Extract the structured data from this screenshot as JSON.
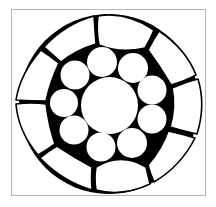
{
  "diagram": {
    "colors": {
      "fill": "#000000",
      "wire": "#ffffff",
      "stroke": "#000000",
      "frame": "#b4b4b4"
    },
    "outer_boundary": {
      "cx": 109,
      "cy": 104,
      "r": 94
    },
    "core": {
      "cx": 109.5,
      "cy": 105.5,
      "r": 28.5
    },
    "inner_ring": [
      {
        "cx": 102,
        "cy": 62,
        "r": 15
      },
      {
        "cx": 133,
        "cy": 68,
        "r": 15
      },
      {
        "cx": 152,
        "cy": 90,
        "r": 14.5
      },
      {
        "cx": 152,
        "cy": 119,
        "r": 14.5
      },
      {
        "cx": 132,
        "cy": 143,
        "r": 15
      },
      {
        "cx": 101,
        "cy": 147,
        "r": 14.5
      },
      {
        "cx": 74,
        "cy": 130,
        "r": 14.5
      },
      {
        "cx": 64,
        "cy": 103,
        "r": 14
      },
      {
        "cx": 75,
        "cy": 75,
        "r": 14.5
      }
    ],
    "outer_wires": [
      {
        "name": "top",
        "d": "M98,16 Q126,11 154,30 Q150,40 145,48 Q121,54 99,45 Q96,30 98,16 Z"
      },
      {
        "name": "upper-right",
        "d": "M159,31 Q186,49 196,75 Q185,81 171,85 Q160,66 148,50 Q153,40 159,31 Z"
      },
      {
        "name": "right",
        "d": "M198,79 Q206,105 197,134 Q183,131 170,127 Q176,107 172,88 Q185,82 198,79 Z"
      },
      {
        "name": "lower-right",
        "d": "M195,138 Q181,166 154,182 Q150,173 148,165 Q163,147 168,131 Q182,134 195,138 Z"
      },
      {
        "name": "bottom",
        "d": "M150,184 Q122,197 96,190 Q94,178 96,167 Q121,152 146,167 Q148,175 150,184 Z"
      },
      {
        "name": "lower-left",
        "d": "M92,190 Q62,181 40,158 Q48,151 57,146 Q75,158 92,167 Q91,178 92,190 Z"
      },
      {
        "name": "left-lower",
        "d": "M38,155 Q18,131 16,104 Q31,102 46,104 Q49,127 55,144 Q47,150 38,155 Z"
      },
      {
        "name": "left-upper",
        "d": "M16,100 Q20,74 41,50 Q50,56 59,63 Q50,82 46,101 Q31,101 16,100 Z"
      },
      {
        "name": "top-left",
        "d": "M44,47 Q65,24 94,16 Q95,30 96,44 Q76,50 61,62 Q52,54 44,47 Z"
      }
    ]
  }
}
